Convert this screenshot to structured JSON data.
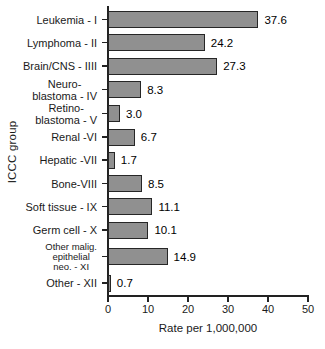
{
  "chart_data": {
    "type": "bar",
    "orientation": "horizontal",
    "title": "",
    "xlabel": "Rate per 1,000,000",
    "ylabel": "ICCC group",
    "xlim": [
      0,
      50
    ],
    "x_ticks": [
      "0",
      "10",
      "20",
      "30",
      "40",
      "50"
    ],
    "grid": false,
    "legend": false,
    "bar_color": "#909090",
    "bar_border_color": "#262626",
    "axis_color": "#222222",
    "categories": [
      "Leukemia - I",
      "Lymphoma - II",
      "Brain/CNS - IIII",
      "Neuro-\nblastoma - IV",
      "Retino-\nblastoma - V",
      "Renal -VI",
      "Hepatic -VII",
      "Bone-VIII",
      "Soft tissue - IX",
      "Germ cell - X",
      "Other malig.\nepithelial\nneo. - XI",
      "Other - XII"
    ],
    "values": [
      37.6,
      24.2,
      27.3,
      8.3,
      3.0,
      6.7,
      1.7,
      8.5,
      11.1,
      10.1,
      14.9,
      0.7
    ],
    "value_labels": [
      "37.6",
      "24.2",
      "27.3",
      "8.3",
      "3.0",
      "6.7",
      "1.7",
      "8.5",
      "11.1",
      "10.1",
      "14.9",
      "0.7"
    ]
  }
}
